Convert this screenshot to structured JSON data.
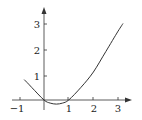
{
  "chart_data": {
    "type": "line",
    "title": "",
    "xlabel": "",
    "ylabel": "",
    "xlim": [
      -1.2,
      3.5
    ],
    "ylim": [
      -0.3,
      3.5
    ],
    "grid": false,
    "x_ticks": [
      "−1",
      "1",
      "2",
      "3"
    ],
    "y_ticks": [
      "1",
      "2",
      "3"
    ],
    "series": [
      {
        "name": "f(x)",
        "x": [
          -0.8,
          -0.5,
          0,
          0.25,
          0.5,
          0.75,
          1,
          1.5,
          2,
          2.5,
          3,
          3.2
        ],
        "y": [
          0.8,
          0.5,
          0,
          -0.12,
          -0.16,
          -0.12,
          0,
          0.5,
          1.1,
          1.9,
          2.7,
          3.0
        ]
      }
    ],
    "color": "#333333"
  }
}
